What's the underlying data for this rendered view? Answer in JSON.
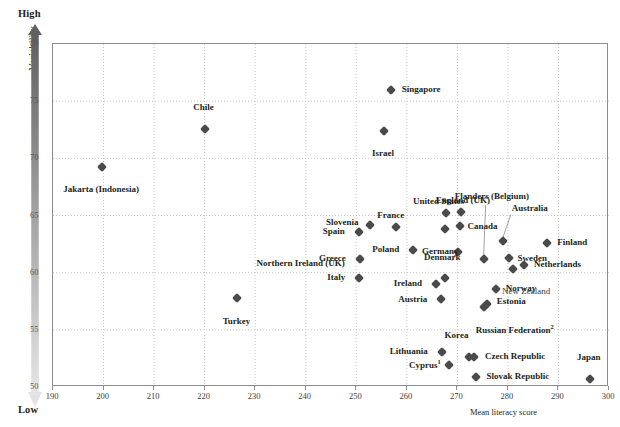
{
  "axes": {
    "y_title": "Variability",
    "y_high": "High",
    "y_low": "Low",
    "x_title": "Mean literacy score",
    "y_ticks": [
      "80",
      "75",
      "70",
      "65",
      "60",
      "55",
      "50"
    ],
    "x_ticks": [
      "190",
      "200",
      "210",
      "220",
      "230",
      "240",
      "250",
      "260",
      "270",
      "280",
      "290",
      "300"
    ]
  },
  "colors": {
    "marker": "#4a4a4a",
    "grid": "#b9b9b9",
    "frame": "#8d8d8d",
    "text": "#231f20",
    "gradient_dark": "#5f5f5f",
    "gradient_light": "#e3e3e3"
  },
  "chart_data": {
    "type": "scatter",
    "title": "",
    "xlabel": "Mean literacy score",
    "ylabel": "Variability",
    "xlim": [
      190,
      300
    ],
    "ylim": [
      50,
      80
    ],
    "grid": true,
    "legend": "none",
    "x_ticks": [
      190,
      200,
      210,
      220,
      230,
      240,
      250,
      260,
      270,
      280,
      290,
      300
    ],
    "y_ticks": [
      50,
      55,
      60,
      65,
      70,
      75,
      80
    ],
    "y_axis_note": "Gradient bar: dark = High variability (top, 80), light = Low variability (bottom, 50)",
    "points": [
      {
        "label": "Jakarta (Indonesia)",
        "x": 199.7,
        "y": 69.2,
        "pos": "below",
        "bold": true
      },
      {
        "label": "Chile",
        "x": 220.0,
        "y": 72.6,
        "pos": "above",
        "bold": true
      },
      {
        "label": "Turkey",
        "x": 226.5,
        "y": 57.8,
        "pos": "below",
        "bold": true
      },
      {
        "label": "Singapore",
        "x": 256.8,
        "y": 76.0,
        "pos": "right",
        "bold": true
      },
      {
        "label": "Israel",
        "x": 255.5,
        "y": 72.4,
        "pos": "below",
        "bold": true
      },
      {
        "label": "Slovenia",
        "x": 252.8,
        "y": 64.2,
        "pos": "left",
        "bold": true
      },
      {
        "label": "Spain",
        "x": 250.5,
        "y": 63.6,
        "pos": "left",
        "bold": true
      },
      {
        "label": "Greece",
        "x": 250.7,
        "y": 61.2,
        "pos": "left",
        "bold": true
      },
      {
        "label": "Italy",
        "x": 250.6,
        "y": 59.5,
        "pos": "left",
        "bold": true
      },
      {
        "label": "France",
        "x": 257.8,
        "y": 64.0,
        "pos": "above",
        "bold": true
      },
      {
        "label": "Poland",
        "x": 261.3,
        "y": 62.0,
        "pos": "left",
        "bold": true
      },
      {
        "label": "United States",
        "x": 267.7,
        "y": 65.2,
        "pos": "above",
        "bold": true
      },
      {
        "label": "Germany",
        "x": 267.6,
        "y": 63.8,
        "pos": "below",
        "bold": true
      },
      {
        "label": "England (UK)",
        "x": 270.7,
        "y": 65.3,
        "pos": "above",
        "bold": true
      },
      {
        "label": "Canada",
        "x": 270.6,
        "y": 64.1,
        "pos": "right",
        "bold": true
      },
      {
        "label": "Northern Ireland (UK)",
        "x": 270.1,
        "y": 61.8,
        "pos": "leader-left",
        "bold": true
      },
      {
        "label": "Denmark",
        "x": 267.6,
        "y": 59.5,
        "pos": "above",
        "bold": true
      },
      {
        "label": "Ireland",
        "x": 265.8,
        "y": 59.0,
        "pos": "left",
        "bold": true
      },
      {
        "label": "Austria",
        "x": 266.8,
        "y": 57.7,
        "pos": "left",
        "bold": true
      },
      {
        "label": "Flanders (Belgium)",
        "x": 275.2,
        "y": 61.2,
        "pos": "leader-up",
        "bold": true
      },
      {
        "label": "Australia",
        "x": 279.0,
        "y": 62.8,
        "pos": "leader-up",
        "bold": true
      },
      {
        "label": "Sweden",
        "x": 280.3,
        "y": 61.3,
        "pos": "right",
        "bold": true
      },
      {
        "label": "Finland",
        "x": 287.8,
        "y": 62.6,
        "pos": "right",
        "bold": true
      },
      {
        "label": "Netherlands",
        "x": 283.2,
        "y": 60.7,
        "pos": "right",
        "bold": true
      },
      {
        "label": "New Zealand",
        "x": 281.0,
        "y": 60.3,
        "pos": "below-right",
        "bold": false
      },
      {
        "label": "Norway",
        "x": 277.6,
        "y": 58.6,
        "pos": "right",
        "bold": true
      },
      {
        "label": "Estonia",
        "x": 275.8,
        "y": 57.3,
        "pos": "right",
        "bold": true
      },
      {
        "label": "Russian Federation",
        "superscript": "2",
        "x": 275.2,
        "y": 57.0,
        "pos": "below-right",
        "bold": true
      },
      {
        "label": "Lithuania",
        "x": 266.9,
        "y": 53.1,
        "pos": "left",
        "bold": true
      },
      {
        "label": "Korea",
        "x": 272.4,
        "y": 52.6,
        "pos": "above",
        "bold": true
      },
      {
        "label": "Czech Republic",
        "x": 273.3,
        "y": 52.6,
        "pos": "right",
        "bold": true
      },
      {
        "label": "Cyprus",
        "superscript": "1",
        "x": 268.3,
        "y": 51.9,
        "pos": "left",
        "bold": true
      },
      {
        "label": "Slovak Republic",
        "x": 273.6,
        "y": 50.9,
        "pos": "right",
        "bold": true
      },
      {
        "label": "Japan",
        "x": 296.2,
        "y": 50.7,
        "pos": "above",
        "bold": true
      }
    ]
  }
}
